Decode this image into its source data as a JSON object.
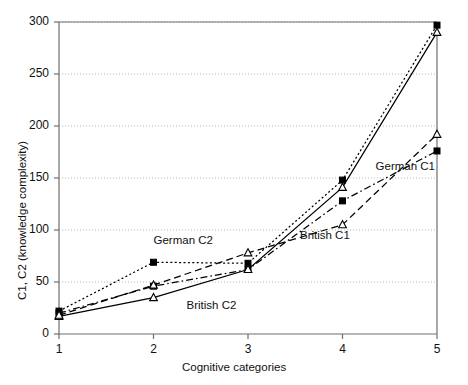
{
  "chart_data": {
    "type": "line",
    "title": "",
    "xlabel": "Cognitive categories",
    "ylabel": "C1, C2 (knowledge complexity)",
    "x": [
      1,
      2,
      3,
      4,
      5
    ],
    "xtick_labels": [
      "1",
      "2",
      "3",
      "4",
      "5"
    ],
    "ytick_labels": [
      "0",
      "50",
      "100",
      "150",
      "200",
      "250",
      "300"
    ],
    "yticks": [
      0,
      50,
      100,
      150,
      200,
      250,
      300
    ],
    "xlim": [
      1,
      5
    ],
    "ylim": [
      0,
      300
    ],
    "grid": "horizontal-dotted",
    "legend": "inline-annotations",
    "series": [
      {
        "name": "German C2",
        "values": [
          22,
          69,
          68,
          148,
          297
        ],
        "marker": "filled-square",
        "line_style": "dotted",
        "color": "#000000",
        "label_x": 2.0,
        "label_y": 88
      },
      {
        "name": "German C1",
        "values": [
          20,
          46,
          62,
          128,
          176
        ],
        "marker": "filled-square",
        "line_style": "dash-dot",
        "color": "#000000",
        "label_x": 4.35,
        "label_y": 160
      },
      {
        "name": "British C2",
        "values": [
          17,
          35,
          62,
          141,
          290
        ],
        "marker": "open-triangle",
        "line_style": "solid",
        "color": "#000000",
        "label_x": 2.35,
        "label_y": 26
      },
      {
        "name": "British C1",
        "values": [
          18,
          47,
          78,
          105,
          192
        ],
        "marker": "open-triangle",
        "line_style": "dashed",
        "color": "#000000",
        "label_x": 3.55,
        "label_y": 93
      }
    ]
  },
  "axis": {
    "x_title": "Cognitive categories",
    "y_title": "C1, C2 (knowledge complexity)"
  },
  "annotations": {
    "german_c2": "German C2",
    "german_c1": "German C1",
    "british_c2": "British C2",
    "british_c1": "British C1"
  },
  "ticks": {
    "y": [
      "300",
      "250",
      "200",
      "150",
      "100",
      "50",
      "0"
    ],
    "x": [
      "1",
      "2",
      "3",
      "4",
      "5"
    ]
  }
}
